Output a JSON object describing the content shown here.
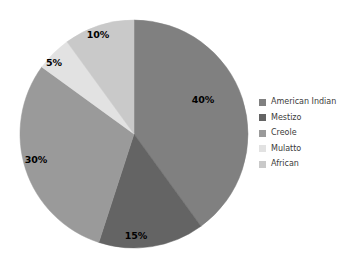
{
  "chart_data": {
    "type": "pie",
    "title": "",
    "categories": [
      "American Indian",
      "Mestizo",
      "Creole",
      "Mulatto",
      "African"
    ],
    "values": [
      40,
      15,
      30,
      5,
      10
    ],
    "value_labels": [
      "40%",
      "15%",
      "30%",
      "5%",
      "10%"
    ],
    "units": "percent",
    "total": 100,
    "start_angle_deg": 0,
    "direction": "clockwise",
    "legend_position": "right",
    "grid": false,
    "background_color": "#ffffff",
    "colors": [
      "#808080",
      "#646464",
      "#9a9a9a",
      "#e2e2e2",
      "#c9c9c9"
    ],
    "label_color": "#000000",
    "legend_text_color": "#3b3b3b",
    "slices": [
      {
        "name": "American Indian",
        "value": 40,
        "label": "40%",
        "color": "#808080",
        "label_x": 203,
        "label_y": 103
      },
      {
        "name": "Mestizo",
        "value": 15,
        "label": "15%",
        "color": "#646464",
        "label_x": 136,
        "label_y": 239
      },
      {
        "name": "Creole",
        "value": 30,
        "label": "30%",
        "color": "#9a9a9a",
        "label_x": 36,
        "label_y": 163
      },
      {
        "name": "Mulatto",
        "value": 5,
        "label": "5%",
        "color": "#e2e2e2",
        "label_x": 54,
        "label_y": 66
      },
      {
        "name": "African",
        "value": 10,
        "label": "10%",
        "color": "#c9c9c9",
        "label_x": 98,
        "label_y": 38
      }
    ]
  },
  "legend": {
    "items": [
      {
        "label": "American Indian",
        "color": "#808080"
      },
      {
        "label": "Mestizo",
        "color": "#646464"
      },
      {
        "label": "Creole",
        "color": "#9a9a9a"
      },
      {
        "label": "Mulatto",
        "color": "#e2e2e2"
      },
      {
        "label": "African",
        "color": "#c9c9c9"
      }
    ]
  }
}
